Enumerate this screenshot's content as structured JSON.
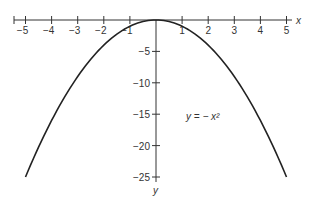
{
  "chart_data": {
    "type": "line",
    "title": "",
    "function": "y = -x^2",
    "annotation": "y = − x²",
    "xlabel": "x",
    "ylabel": "y",
    "xlim": [
      -5,
      5
    ],
    "ylim": [
      -25,
      0
    ],
    "x_ticks": [
      -5,
      -4,
      -3,
      -2,
      -1,
      1,
      2,
      3,
      4,
      5
    ],
    "x_tick_labels": [
      "−5",
      "−4",
      "−3",
      "−2",
      "−1",
      "1",
      "2",
      "3",
      "4",
      "5"
    ],
    "y_ticks": [
      -5,
      -10,
      -15,
      -20,
      -25
    ],
    "y_tick_labels": [
      "−5",
      "−10",
      "−15",
      "−20",
      "−25"
    ],
    "grid": false,
    "legend": null,
    "series": [
      {
        "name": "y = -x^2",
        "x": [
          -5,
          -4,
          -3,
          -2,
          -1,
          0,
          1,
          2,
          3,
          4,
          5
        ],
        "y": [
          -25,
          -16,
          -9,
          -4,
          -1,
          0,
          -1,
          -4,
          -9,
          -16,
          -25
        ]
      }
    ]
  }
}
